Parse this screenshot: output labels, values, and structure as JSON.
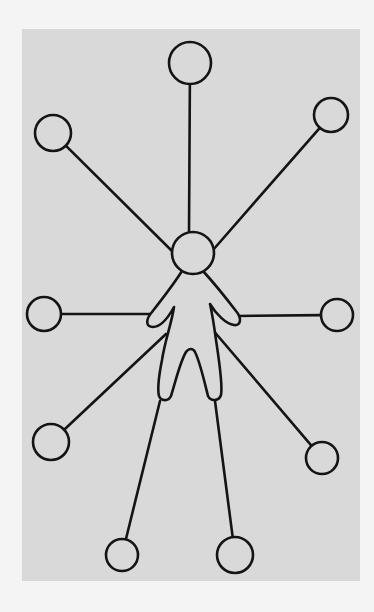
{
  "diagram": {
    "type": "hub-and-spoke",
    "colors": {
      "page_background": "#f4f4f4",
      "panel_background": "#d9d9d9",
      "stroke": "#141414"
    },
    "panel": {
      "x": 22,
      "y": 29,
      "width": 338,
      "height": 552
    },
    "center_figure": {
      "label": "person",
      "head": {
        "cx": 193,
        "cy": 253,
        "r": 21
      }
    },
    "nodes": [
      {
        "id": "top",
        "cx": 190,
        "cy": 63,
        "r": 21,
        "anchor_x": 189,
        "anchor_y": 232
      },
      {
        "id": "top-left",
        "cx": 53,
        "cy": 133,
        "r": 18,
        "anchor_x": 174,
        "anchor_y": 253
      },
      {
        "id": "top-right",
        "cx": 331,
        "cy": 115,
        "r": 17,
        "anchor_x": 213,
        "anchor_y": 250
      },
      {
        "id": "mid-left",
        "cx": 44,
        "cy": 314,
        "r": 17,
        "anchor_x": 152,
        "anchor_y": 314
      },
      {
        "id": "mid-right",
        "cx": 337,
        "cy": 315,
        "r": 16,
        "anchor_x": 236,
        "anchor_y": 316
      },
      {
        "id": "lower-left",
        "cx": 51,
        "cy": 442,
        "r": 18,
        "anchor_x": 166,
        "anchor_y": 334
      },
      {
        "id": "lower-right",
        "cx": 322,
        "cy": 458,
        "r": 16,
        "anchor_x": 212,
        "anchor_y": 329
      },
      {
        "id": "bottom-left",
        "cx": 122,
        "cy": 555,
        "r": 16,
        "anchor_x": 160,
        "anchor_y": 401
      },
      {
        "id": "bottom-right",
        "cx": 235,
        "cy": 555,
        "r": 18,
        "anchor_x": 215,
        "anchor_y": 401
      }
    ],
    "node_count": 9
  }
}
